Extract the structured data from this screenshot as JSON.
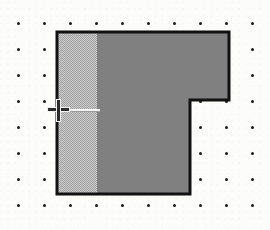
{
  "canvas": {
    "width": 270,
    "height": 230,
    "background_color": "#fcfcfb",
    "label": "Drawing canvas"
  },
  "grid": {
    "name": "dot-grid",
    "visible": true,
    "dot_color": "#1a1a1a",
    "dot_size_px": 3,
    "spacing_x_px": 26,
    "spacing_y_px": 26,
    "origin_x_px": 18,
    "origin_y_px": 23,
    "columns": 10,
    "rows": 8
  },
  "shape": {
    "name": "notched-rectangle",
    "type": "polygon",
    "outline_color": "#111111",
    "outline_width_px": 3,
    "fill_primary_color": "#808080",
    "fill_secondary_color": "#b8b8b8",
    "fill_secondary_pattern": "50-percent-dither",
    "selected": true,
    "vertices": [
      {
        "x": 57,
        "y": 32
      },
      {
        "x": 229,
        "y": 32
      },
      {
        "x": 229,
        "y": 100
      },
      {
        "x": 190,
        "y": 100
      },
      {
        "x": 190,
        "y": 194
      },
      {
        "x": 57,
        "y": 194
      }
    ],
    "band": {
      "name": "left-fill-band",
      "x": 57,
      "y": 32,
      "width": 40,
      "height": 162
    }
  },
  "cursor": {
    "name": "crosshair-cursor",
    "type": "crosshair",
    "x": 58,
    "y": 110,
    "color": "#2b2b2b",
    "halo_color": "#f2f2f2",
    "size_px": 21
  },
  "drag_line": {
    "name": "horizontal-guide-line",
    "visible": true,
    "x_start": 62,
    "x_end": 100,
    "y": 109,
    "color": "#efefef"
  },
  "status": {
    "tool": "crosshair",
    "description": "Notched rectangle shape with dithered left band on dot grid"
  }
}
